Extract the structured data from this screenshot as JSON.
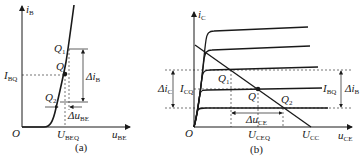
{
  "panels": [
    {
      "id": "a",
      "caption": "(a)",
      "y_axis": {
        "var": "i",
        "sub": "B"
      },
      "x_axis": {
        "var": "u",
        "sub": "BE"
      },
      "origin": "O",
      "points": {
        "q": {
          "var": "Q",
          "sub": ""
        },
        "q1": {
          "var": "Q",
          "sub": "1"
        },
        "q2": {
          "var": "Q",
          "sub": "2"
        }
      },
      "labels": {
        "ibq": {
          "var": "I",
          "sub": "BQ"
        },
        "ubeq": {
          "var": "U",
          "sub": "BEQ"
        },
        "delta_ib": {
          "var": "Δi",
          "sub": "B"
        },
        "delta_ube": {
          "var": "Δu",
          "sub": "BE"
        }
      }
    },
    {
      "id": "b",
      "caption": "(b)",
      "y_axis": {
        "var": "i",
        "sub": "C"
      },
      "x_axis": {
        "var": "u",
        "sub": "CE"
      },
      "origin": "O",
      "points": {
        "q": {
          "var": "Q",
          "sub": ""
        },
        "q1": {
          "var": "Q",
          "sub": "1"
        },
        "q2": {
          "var": "Q",
          "sub": "2"
        }
      },
      "labels": {
        "icq": {
          "var": "I",
          "sub": "CQ"
        },
        "ibq": {
          "var": "I",
          "sub": "BQ"
        },
        "uceq": {
          "var": "U",
          "sub": "CEQ"
        },
        "ucc": {
          "var": "U",
          "sub": "CC"
        },
        "delta_ic": {
          "var": "Δi",
          "sub": "C"
        },
        "delta_ib": {
          "var": "Δi",
          "sub": "B"
        },
        "delta_uce": {
          "var": "Δu",
          "sub": "CE"
        }
      },
      "curve_count": 5
    }
  ],
  "colors": {
    "ink": "#1a1a1a",
    "background": "#ffffff"
  }
}
